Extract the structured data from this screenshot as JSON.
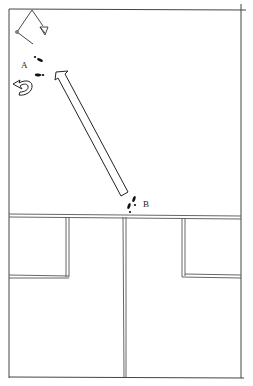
{
  "diagram": {
    "type": "floor-plan-movement",
    "labels": {
      "position_a": "A",
      "position_b": "B"
    },
    "elements": {
      "room_outline": "rectangular room",
      "upper_area": "open floor",
      "lower_area": "two cubicles/booths divided by a center wall",
      "straight_arrow": "movement from B toward A",
      "curved_arrow": "turn at A",
      "compass_marker": "direction indicator top-left"
    },
    "colors": {
      "line": "#333333",
      "background": "#ffffff"
    }
  }
}
